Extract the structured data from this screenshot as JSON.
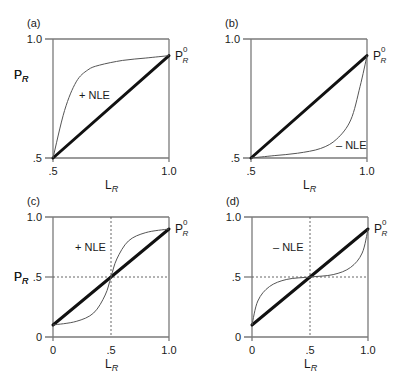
{
  "figure": {
    "panels": [
      {
        "id": "a",
        "label": "(a)",
        "y_label": "P",
        "y_sub": "R",
        "x_label": "L",
        "x_sub": "R",
        "y_ticks": [
          "1.0",
          ".5"
        ],
        "x_ticks": [
          ".5",
          "1.0"
        ],
        "end_label": "P",
        "end_sub": "R",
        "end_sup": "0",
        "nle_label": "+ NLE"
      },
      {
        "id": "b",
        "label": "(b)",
        "y_label": "P",
        "y_sub": "R",
        "x_label": "L",
        "x_sub": "R",
        "y_ticks": [
          "1.0",
          ".5"
        ],
        "x_ticks": [
          ".5",
          "1.0"
        ],
        "end_label": "P",
        "end_sub": "R",
        "end_sup": "0",
        "nle_label": "– NLE"
      },
      {
        "id": "c",
        "label": "(c)",
        "y_label": "P",
        "y_sub": "R",
        "x_label": "L",
        "x_sub": "R",
        "y_ticks": [
          "1.0",
          ".5",
          "0"
        ],
        "x_ticks": [
          "0",
          ".5",
          "1.0"
        ],
        "end_label": "P",
        "end_sub": "R",
        "end_sup": "0",
        "nle_label": "+ NLE"
      },
      {
        "id": "d",
        "label": "(d)",
        "y_label": "P",
        "y_sub": "R",
        "x_label": "L",
        "x_sub": "R",
        "y_ticks": [
          "1.0",
          ".5",
          "0"
        ],
        "x_ticks": [
          "0",
          ".5",
          "1.0"
        ],
        "end_label": "P",
        "end_sub": "R",
        "end_sup": "0",
        "nle_label": "– NLE"
      }
    ]
  },
  "chart_data": [
    {
      "type": "line",
      "title": "(a)",
      "xlabel": "L_R",
      "ylabel": "P_R",
      "xlim": [
        0.5,
        1.0
      ],
      "ylim": [
        0.5,
        1.0
      ],
      "grid": false,
      "annotations": [
        "+ NLE",
        "P_R^0"
      ],
      "series": [
        {
          "name": "linear",
          "style": "thick",
          "x": [
            0.5,
            1.0
          ],
          "y": [
            0.5,
            0.93
          ]
        },
        {
          "name": "+ NLE",
          "style": "thin",
          "x": [
            0.5,
            0.55,
            0.6,
            0.65,
            0.7,
            0.8,
            0.9,
            1.0
          ],
          "y": [
            0.5,
            0.7,
            0.82,
            0.87,
            0.89,
            0.91,
            0.92,
            0.93
          ]
        }
      ]
    },
    {
      "type": "line",
      "title": "(b)",
      "xlabel": "L_R",
      "ylabel": "P_R",
      "xlim": [
        0.5,
        1.0
      ],
      "ylim": [
        0.5,
        1.0
      ],
      "grid": false,
      "annotations": [
        "– NLE",
        "P_R^0"
      ],
      "series": [
        {
          "name": "linear",
          "style": "thick",
          "x": [
            0.5,
            1.0
          ],
          "y": [
            0.5,
            0.93
          ]
        },
        {
          "name": "– NLE",
          "style": "thin",
          "x": [
            0.5,
            0.6,
            0.7,
            0.8,
            0.87,
            0.93,
            0.97,
            1.0
          ],
          "y": [
            0.5,
            0.51,
            0.52,
            0.54,
            0.58,
            0.66,
            0.8,
            0.93
          ]
        }
      ]
    },
    {
      "type": "line",
      "title": "(c)",
      "xlabel": "L_R",
      "ylabel": "P_R",
      "xlim": [
        0,
        1.0
      ],
      "ylim": [
        0,
        1.0
      ],
      "grid": false,
      "reference_lines": {
        "x": 0.5,
        "y": 0.5,
        "style": "dashed"
      },
      "annotations": [
        "+ NLE",
        "P_R^0"
      ],
      "series": [
        {
          "name": "linear",
          "style": "thick",
          "x": [
            0,
            1.0
          ],
          "y": [
            0.1,
            0.9
          ]
        },
        {
          "name": "+ NLE",
          "style": "thin",
          "x": [
            0,
            0.2,
            0.35,
            0.45,
            0.5,
            0.55,
            0.65,
            0.8,
            1.0
          ],
          "y": [
            0.1,
            0.13,
            0.2,
            0.35,
            0.5,
            0.65,
            0.8,
            0.87,
            0.9
          ]
        }
      ]
    },
    {
      "type": "line",
      "title": "(d)",
      "xlabel": "L_R",
      "ylabel": "P_R",
      "xlim": [
        0,
        1.0
      ],
      "ylim": [
        0,
        1.0
      ],
      "grid": false,
      "reference_lines": {
        "x": 0.5,
        "y": 0.5,
        "style": "dashed"
      },
      "annotations": [
        "– NLE",
        "P_R^0"
      ],
      "series": [
        {
          "name": "linear",
          "style": "thick",
          "x": [
            0,
            1.0
          ],
          "y": [
            0.1,
            0.9
          ]
        },
        {
          "name": "– NLE",
          "style": "thin",
          "x": [
            0,
            0.05,
            0.15,
            0.3,
            0.5,
            0.7,
            0.85,
            0.95,
            1.0
          ],
          "y": [
            0.1,
            0.3,
            0.42,
            0.48,
            0.5,
            0.52,
            0.58,
            0.7,
            0.9
          ]
        }
      ]
    }
  ]
}
